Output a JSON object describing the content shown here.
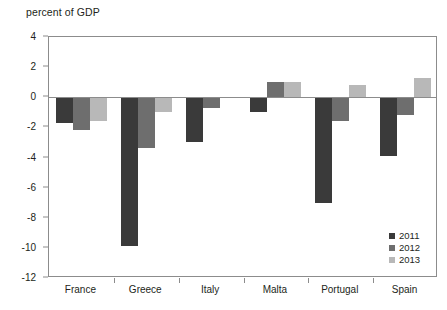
{
  "chart_data": {
    "type": "bar",
    "title": "percent of GDP",
    "xlabel": "",
    "ylabel": "",
    "ylim": [
      -12,
      4
    ],
    "yticks": [
      4,
      2,
      0,
      -2,
      -4,
      -6,
      -8,
      -10,
      -12
    ],
    "ytick_labels": [
      "4",
      "2",
      "0",
      "-2",
      "-4",
      "-6",
      "-8",
      "-10",
      "-12"
    ],
    "grid": false,
    "legend_position": "bottom-right",
    "categories": [
      "France",
      "Greece",
      "Italy",
      "Malta",
      "Portugal",
      "Spain"
    ],
    "series": [
      {
        "name": "2011",
        "color": "#3a3a3a",
        "values": [
          -1.7,
          -9.9,
          -3.0,
          -1.0,
          -7.0,
          -3.9
        ]
      },
      {
        "name": "2012",
        "color": "#6e6e6e",
        "values": [
          -2.2,
          -3.4,
          -0.7,
          1.0,
          -1.6,
          -1.2
        ]
      },
      {
        "name": "2013",
        "color": "#b8b8b8",
        "values": [
          -1.6,
          -1.0,
          0.0,
          1.0,
          0.8,
          1.3
        ]
      }
    ]
  },
  "axis": {
    "line_color": "#8c8c8c"
  }
}
